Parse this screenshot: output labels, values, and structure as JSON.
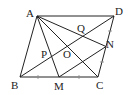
{
  "diagram": {
    "type": "geometry",
    "shape": "parallelogram ABCD",
    "points": {
      "A": {
        "label": "A"
      },
      "B": {
        "label": "B"
      },
      "C": {
        "label": "C"
      },
      "D": {
        "label": "D"
      },
      "M": {
        "label": "M"
      },
      "N": {
        "label": "N"
      },
      "O": {
        "label": "O"
      },
      "P": {
        "label": "P"
      },
      "Q": {
        "label": "Q"
      }
    },
    "segments": [
      "AB",
      "BC",
      "CD",
      "DA",
      "AC",
      "BD",
      "AM",
      "AN",
      "MN"
    ],
    "equal_marks": [
      "BM=MC",
      "CN=ND"
    ]
  }
}
